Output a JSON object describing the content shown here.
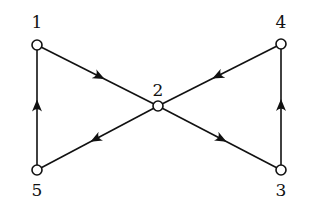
{
  "diagram": {
    "type": "directed-graph",
    "nodes": [
      {
        "id": "1",
        "label": "1",
        "x": 37,
        "y": 45,
        "label_x": 37,
        "label_y": 28
      },
      {
        "id": "2",
        "label": "2",
        "x": 158,
        "y": 106,
        "label_x": 158,
        "label_y": 96
      },
      {
        "id": "3",
        "label": "3",
        "x": 281,
        "y": 170,
        "label_x": 281,
        "label_y": 196
      },
      {
        "id": "4",
        "label": "4",
        "x": 281,
        "y": 44,
        "label_x": 281,
        "label_y": 28
      },
      {
        "id": "5",
        "label": "5",
        "x": 37,
        "y": 170,
        "label_x": 37,
        "label_y": 196
      }
    ],
    "edges": [
      {
        "from": "1",
        "to": "2"
      },
      {
        "from": "2",
        "to": "3"
      },
      {
        "from": "3",
        "to": "4"
      },
      {
        "from": "4",
        "to": "2"
      },
      {
        "from": "2",
        "to": "5"
      },
      {
        "from": "5",
        "to": "1"
      }
    ],
    "colors": {
      "stroke": "#111111",
      "background": "#ffffff"
    }
  }
}
